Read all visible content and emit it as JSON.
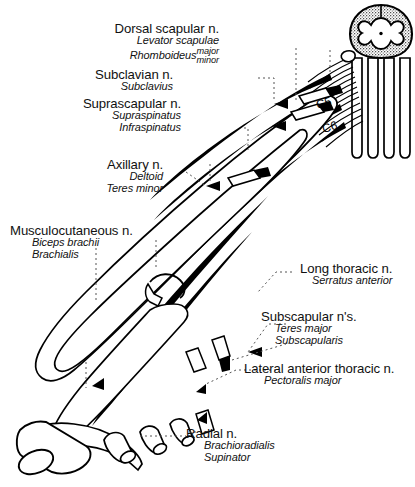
{
  "figure": {
    "background_color": "#ffffff",
    "ink_color": "#000000"
  },
  "spinal_roots": [
    {
      "id": "c5",
      "label": "C5"
    },
    {
      "id": "c6",
      "label": "C6"
    }
  ],
  "labels": {
    "dorsal_scapular": {
      "nerve": "Dorsal scapular n.",
      "muscles": [
        "Levator scapulae",
        "Rhomboideus"
      ],
      "muscle_variants": [
        "major",
        "minor"
      ]
    },
    "subclavian": {
      "nerve": "Subclavian n.",
      "muscles": [
        "Subclavius"
      ]
    },
    "suprascapular": {
      "nerve": "Suprascapular n.",
      "muscles": [
        "Supraspinatus",
        "Infraspinatus"
      ]
    },
    "axillary": {
      "nerve": "Axillary n.",
      "muscles": [
        "Deltoid",
        "Teres minor"
      ]
    },
    "musculocutaneous": {
      "nerve": "Musculocutaneous n.",
      "muscles": [
        "Biceps brachii",
        "Brachialis"
      ]
    },
    "long_thoracic": {
      "nerve": "Long thoracic n.",
      "muscles": [
        "Serratus anterior"
      ]
    },
    "subscapular": {
      "nerve": "Subscapular n's.",
      "muscles": [
        "Teres major",
        "Subscapularis"
      ]
    },
    "lateral_anterior_thoracic": {
      "nerve": "Lateral anterior thoracic n.",
      "muscles": [
        "Pectoralis major"
      ]
    },
    "radial": {
      "nerve": "Radial n.",
      "muscles": [
        "Brachioradialis",
        "Supinator"
      ]
    }
  }
}
